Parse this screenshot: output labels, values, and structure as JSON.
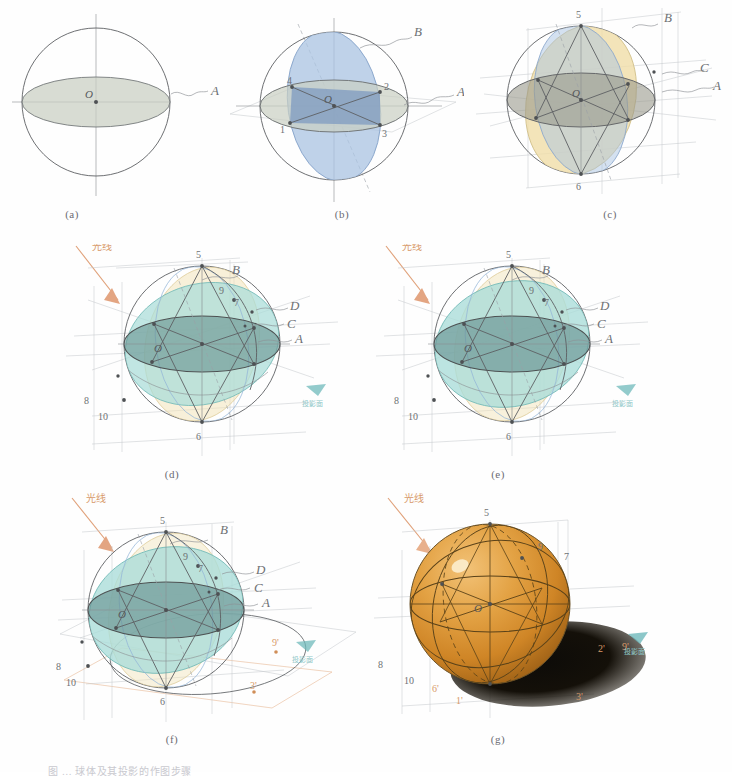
{
  "figure": {
    "title_caption": "图 …  球体及其投影的作图步骤",
    "panel_captions": [
      "(a)",
      "(b)",
      "(c)",
      "(d)",
      "(e)",
      "(f)",
      "(g)"
    ],
    "surface_labels": [
      "A",
      "B",
      "C",
      "D"
    ],
    "point_labels": [
      "1",
      "2",
      "3",
      "4",
      "5",
      "6",
      "7",
      "8",
      "9",
      "10"
    ],
    "center_label": "O",
    "shadow_point_labels": [
      "2'",
      "9'",
      "3'",
      "1'",
      "6'",
      "10'"
    ],
    "light_note": "光线",
    "axis_note": "投影面",
    "colors": {
      "plane_a": "#c9cfc2",
      "plane_b": "#a9c3e2",
      "plane_b_dark": "#7d9cc6",
      "plane_c": "#f0dda8",
      "plane_d": "#a9dcd8",
      "sphere": "#e09a3c",
      "shadow": "#1a1713",
      "ink": "#5d6063",
      "light_arrow": "#e0a078",
      "note_teal": "#8fc8c8"
    }
  },
  "panels": [
    {
      "id": "a",
      "caption": "(a)",
      "description": "Sphere outline with horizontal great circle A shaded grey-green, vertical and horizontal axes through centre O.",
      "labels": [
        "A",
        "O"
      ]
    },
    {
      "id": "b",
      "caption": "(b)",
      "description": "Sphere with horizontal plane A and vertical blue plane B intersecting; numbered intersection points.",
      "labels": [
        "A",
        "B",
        "O",
        "1",
        "2",
        "3",
        "4"
      ]
    },
    {
      "id": "c",
      "caption": "(c)",
      "description": "Sphere with planes A, B and an inclined yellow plane C plus projection construction lines.",
      "labels": [
        "A",
        "B",
        "C",
        "O",
        "5",
        "6"
      ]
    },
    {
      "id": "d",
      "caption": "(d)",
      "description": "Sphere with planes A, B, C and a teal plane D, light-ray arrow at upper left, projection box.",
      "labels": [
        "A",
        "B",
        "C",
        "D",
        "O",
        "5",
        "6",
        "7",
        "8",
        "9",
        "10"
      ]
    },
    {
      "id": "e",
      "caption": "(e)",
      "description": "Same as (d) with the teal plane D fully developed over the sphere.",
      "labels": [
        "A",
        "B",
        "C",
        "D",
        "O",
        "5",
        "6",
        "7",
        "8",
        "9",
        "10"
      ]
    },
    {
      "id": "f",
      "caption": "(f)",
      "description": "Construction with the cast-shadow ellipse projected onto the ground plane; primed shadow points.",
      "labels": [
        "A",
        "B",
        "C",
        "D",
        "O",
        "5",
        "6",
        "7",
        "8",
        "9",
        "10",
        "2'",
        "9'",
        "3'"
      ]
    },
    {
      "id": "g",
      "caption": "(g)",
      "description": "Finished rendering: shaded orange sphere with highlight, dark cast shadow ellipse, retained construction labels.",
      "labels": [
        "O",
        "5",
        "7",
        "8",
        "9",
        "10",
        "2'",
        "9'",
        "3'",
        "1'"
      ]
    }
  ]
}
